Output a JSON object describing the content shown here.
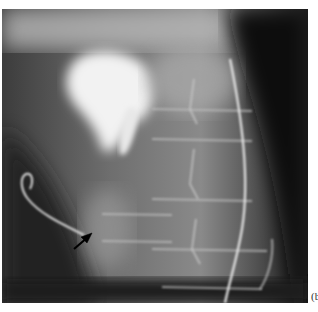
{
  "figure": {
    "type": "radiograph",
    "modality": "X-ray",
    "panel_label": "(b",
    "annotations": [
      {
        "kind": "arrow",
        "color": "#000000",
        "direction": "pointing up-right",
        "approx_position": [
          85,
          232
        ]
      }
    ]
  }
}
